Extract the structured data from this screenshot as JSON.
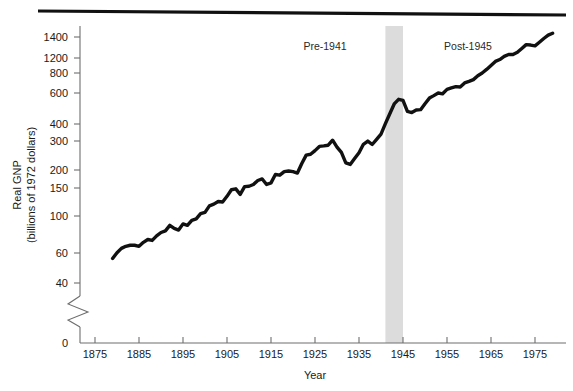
{
  "figure": {
    "top_rule": true,
    "background_color": "#ffffff"
  },
  "chart_data": {
    "type": "line",
    "title": "",
    "xlabel": "Year",
    "ylabel": "Real GNP (billions of 1972 dollars)",
    "ylabel_line1": "Real GNP",
    "ylabel_line2": "(billions of 1972 dollars)",
    "yscale": "log",
    "axis_break": true,
    "axis_break_note": "zigzag break between 40 and 0",
    "xlim": [
      1875,
      1979
    ],
    "ylim": [
      35,
      1500
    ],
    "grid": false,
    "legend": null,
    "xticks": [
      1875,
      1885,
      1895,
      1905,
      1915,
      1925,
      1935,
      1945,
      1955,
      1965,
      1975
    ],
    "yticks": [
      0,
      40,
      60,
      100,
      150,
      200,
      300,
      400,
      600,
      800,
      1200,
      1400
    ],
    "ytick_labels": [
      "0",
      "40",
      "60",
      "100",
      "150",
      "200",
      "300",
      "400",
      "600",
      "800",
      "1200",
      "1400"
    ],
    "line_color": "#111111",
    "shaded_band": {
      "label": "World War II",
      "x_start": 1941,
      "x_end": 1945,
      "color": "#dcdcdc"
    },
    "annotations": [
      {
        "text": "Pre-1941",
        "x": 1925,
        "y": 900
      },
      {
        "text": "Post-1945",
        "x": 1962,
        "y": 900
      }
    ],
    "series": [
      {
        "name": "Real GNP",
        "x": [
          1879,
          1880,
          1881,
          1882,
          1883,
          1884,
          1885,
          1886,
          1887,
          1888,
          1889,
          1890,
          1891,
          1892,
          1893,
          1894,
          1895,
          1896,
          1897,
          1898,
          1899,
          1900,
          1901,
          1902,
          1903,
          1904,
          1905,
          1906,
          1907,
          1908,
          1909,
          1910,
          1911,
          1912,
          1913,
          1914,
          1915,
          1916,
          1917,
          1918,
          1919,
          1920,
          1921,
          1922,
          1923,
          1924,
          1925,
          1926,
          1927,
          1928,
          1929,
          1930,
          1931,
          1932,
          1933,
          1934,
          1935,
          1936,
          1937,
          1938,
          1939,
          1940,
          1941,
          1942,
          1943,
          1944,
          1945,
          1946,
          1947,
          1948,
          1949,
          1950,
          1951,
          1952,
          1953,
          1954,
          1955,
          1956,
          1957,
          1958,
          1959,
          1960,
          1961,
          1962,
          1963,
          1964,
          1965,
          1966,
          1967,
          1968,
          1969,
          1970,
          1971,
          1972,
          1973,
          1974,
          1975,
          1976,
          1977,
          1978,
          1979
        ],
        "y": [
          57,
          62,
          66,
          68,
          69,
          69,
          68,
          72,
          75,
          74,
          79,
          83,
          85,
          92,
          88,
          86,
          94,
          92,
          99,
          101,
          109,
          111,
          122,
          125,
          130,
          129,
          140,
          154,
          156,
          144,
          161,
          162,
          166,
          176,
          180,
          166,
          170,
          192,
          190,
          200,
          202,
          200,
          196,
          225,
          254,
          257,
          271,
          288,
          290,
          293,
          315,
          285,
          264,
          227,
          222,
          242,
          263,
          297,
          311,
          296,
          319,
          344,
          400,
          462,
          532,
          569,
          560,
          478,
          470,
          487,
          490,
          534,
          579,
          600,
          623,
          616,
          657,
          671,
          683,
          680,
          721,
          737,
          756,
          800,
          832,
          876,
          929,
          984,
          1011,
          1058,
          1088,
          1086,
          1122,
          1186,
          1254,
          1246,
          1232,
          1298,
          1370,
          1439,
          1479
        ]
      }
    ]
  }
}
